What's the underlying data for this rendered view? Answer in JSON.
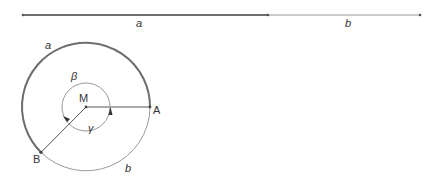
{
  "segment": {
    "label_a": "a",
    "label_b": "b"
  },
  "circle": {
    "center_label": "M",
    "point_a_label": "A",
    "point_b_label": "B",
    "arc_a_label": "a",
    "arc_b_label": "b",
    "angle_beta_label": "β",
    "angle_gamma_label": "γ"
  },
  "colors": {
    "thick_line": "#6e6e6e",
    "thin_line": "#9a9a9a",
    "text": "#333333"
  }
}
